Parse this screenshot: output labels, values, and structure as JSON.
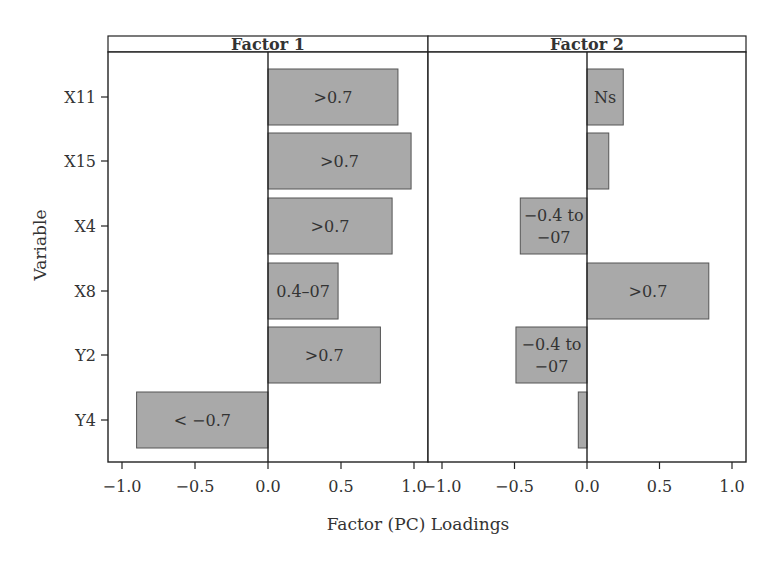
{
  "chart_data": {
    "type": "bar",
    "orientation": "horizontal",
    "title": "",
    "xlabel": "Factor (PC) Loadings",
    "ylabel": "Variable",
    "categories": [
      "X11",
      "X15",
      "X4",
      "X8",
      "Y2",
      "Y4"
    ],
    "xlim": [
      -1.0,
      1.0
    ],
    "xticks": [
      "-1.0",
      "-0.5",
      "0.0",
      "0.5",
      "1.0"
    ],
    "grid": false,
    "legend": null,
    "bar_color": "#a9a9a9",
    "panels": [
      {
        "title": "Factor 1",
        "values": [
          0.89,
          0.98,
          0.85,
          0.48,
          0.77,
          -0.9
        ],
        "labels": [
          ">0.7",
          ">0.7",
          ">0.7",
          "0.4–07",
          ">0.7",
          "< −0.7"
        ]
      },
      {
        "title": "Factor 2",
        "values": [
          0.25,
          0.15,
          -0.46,
          0.84,
          -0.49,
          -0.06
        ],
        "labels": [
          "Ns",
          "",
          "−0.4 to\n−07",
          ">0.7",
          "−0.4 to\n−07",
          ""
        ]
      }
    ]
  }
}
